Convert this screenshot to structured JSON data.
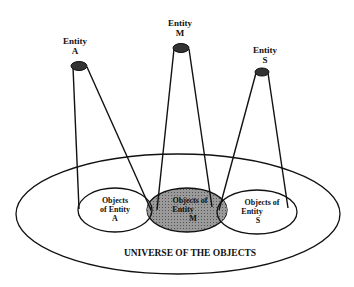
{
  "entities": [
    {
      "id": "A",
      "label_line1": "Entity",
      "label_line2": "A"
    },
    {
      "id": "M",
      "label_line1": "Entity",
      "label_line2": "M"
    },
    {
      "id": "S",
      "label_line1": "Entity",
      "label_line2": "S"
    }
  ],
  "object_sets": [
    {
      "id": "A",
      "lines": [
        "Objects",
        "of Entity",
        "A"
      ]
    },
    {
      "id": "M",
      "lines": [
        "Objects of",
        "Entity",
        "M"
      ]
    },
    {
      "id": "S",
      "lines": [
        "Objects of",
        "Entity",
        "S"
      ]
    }
  ],
  "universe": {
    "label": "UNIVERSE OF THE OBJECTS"
  },
  "colors": {
    "stroke": "#111111",
    "highlight_fill": "#8a8a8a",
    "disc_fill": "#333333"
  }
}
